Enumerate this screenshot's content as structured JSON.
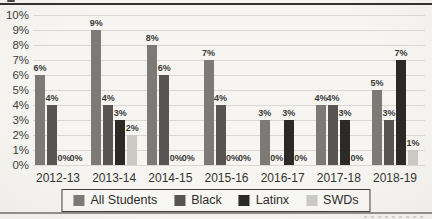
{
  "chart_data": {
    "type": "bar",
    "categories": [
      "2012-13",
      "2013-14",
      "2014-15",
      "2015-16",
      "2016-17",
      "2017-18",
      "2018-19"
    ],
    "series": [
      {
        "name": "All Students",
        "color": "#7b7a77",
        "values": [
          6,
          9,
          8,
          7,
          3,
          4,
          5
        ]
      },
      {
        "name": "Black",
        "color": "#575553",
        "values": [
          4,
          4,
          6,
          4,
          0,
          4,
          3
        ]
      },
      {
        "name": "Latinx",
        "color": "#2b2a27",
        "values": [
          0,
          3,
          0,
          0,
          3,
          3,
          7
        ]
      },
      {
        "name": "SWDs",
        "color": "#cac9c4",
        "values": [
          0,
          2,
          0,
          0,
          0,
          0,
          1
        ]
      }
    ],
    "title": "",
    "xlabel": "",
    "ylabel": "",
    "ylim": [
      0,
      10
    ],
    "yticks": [
      "10%",
      "9%",
      "8%",
      "7%",
      "6%",
      "5%",
      "4%",
      "3%",
      "2%",
      "1%",
      "0%"
    ],
    "value_label_suffix": "%",
    "grid": true,
    "legend_position": "bottom",
    "legend_labels": [
      "All Students",
      "Black",
      "Latinx",
      "SWDs"
    ]
  },
  "page": {
    "background": "#f4f3f0",
    "top_rule_color": "#34322f",
    "bottom_rule_color": "#8f8e8a"
  }
}
